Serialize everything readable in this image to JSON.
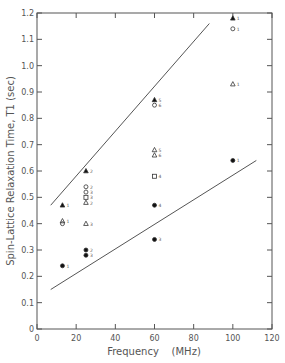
{
  "chart_data": {
    "type": "scatter",
    "title": "",
    "xlabel": "Frequency    (MHz)",
    "ylabel": "Spin-Lattice Relaxation Time, T1 (sec)",
    "xlim": [
      0,
      120
    ],
    "ylim": [
      0,
      1.2
    ],
    "xticks": [
      0,
      20,
      40,
      60,
      80,
      100,
      120
    ],
    "yticks": [
      0,
      0.1,
      0.2,
      0.3,
      0.4,
      0.5,
      0.6,
      0.7,
      0.8,
      0.9,
      1.0,
      1.1,
      1.2
    ],
    "xtick_labels": [
      "0",
      "20",
      "40",
      "60",
      "80",
      "100",
      "120"
    ],
    "ytick_labels": [
      "0",
      "0.1",
      "0.2",
      "0.3",
      "0.4",
      "0.5",
      "0.6",
      "0.7",
      "0.8",
      "0.9",
      "1.0",
      "1.1",
      "1.2"
    ],
    "grid": false,
    "legend": null,
    "series": [
      {
        "name": "filled-triangle",
        "marker": "triangle-filled",
        "points": [
          {
            "x": 13,
            "y": 0.47,
            "label": "1"
          },
          {
            "x": 25,
            "y": 0.6,
            "label": "2"
          },
          {
            "x": 60,
            "y": 0.87,
            "label": "5"
          },
          {
            "x": 100,
            "y": 1.18,
            "label": "1"
          }
        ]
      },
      {
        "name": "open-circle",
        "marker": "circle-open",
        "points": [
          {
            "x": 25,
            "y": 0.54,
            "label": "2"
          },
          {
            "x": 25,
            "y": 0.52,
            "label": "3"
          },
          {
            "x": 60,
            "y": 0.85,
            "label": "6"
          },
          {
            "x": 100,
            "y": 1.14,
            "label": "1"
          }
        ]
      },
      {
        "name": "open-square",
        "marker": "square-open",
        "points": [
          {
            "x": 25,
            "y": 0.5,
            "label": "3"
          },
          {
            "x": 60,
            "y": 0.58,
            "label": "4"
          }
        ]
      },
      {
        "name": "open-triangle",
        "marker": "triangle-open",
        "points": [
          {
            "x": 13,
            "y": 0.41,
            "label": "1"
          },
          {
            "x": 25,
            "y": 0.48,
            "label": "2"
          },
          {
            "x": 25,
            "y": 0.4,
            "label": "3"
          },
          {
            "x": 60,
            "y": 0.68,
            "label": "5"
          },
          {
            "x": 60,
            "y": 0.66,
            "label": "6"
          },
          {
            "x": 100,
            "y": 0.93,
            "label": "1"
          }
        ]
      },
      {
        "name": "open-circle-low",
        "marker": "circle-open",
        "points": [
          {
            "x": 13,
            "y": 0.4,
            "label": ""
          }
        ]
      },
      {
        "name": "filled-circle",
        "marker": "circle-filled",
        "points": [
          {
            "x": 13,
            "y": 0.24,
            "label": "1"
          },
          {
            "x": 25,
            "y": 0.3,
            "label": "2"
          },
          {
            "x": 25,
            "y": 0.28,
            "label": "3"
          },
          {
            "x": 60,
            "y": 0.47,
            "label": "4"
          },
          {
            "x": 60,
            "y": 0.34,
            "label": "3"
          },
          {
            "x": 100,
            "y": 0.64,
            "label": "1"
          }
        ]
      }
    ],
    "lines": [
      {
        "name": "upper-bound",
        "x": [
          7,
          88
        ],
        "y": [
          0.47,
          1.16
        ]
      },
      {
        "name": "lower-bound",
        "x": [
          7,
          112
        ],
        "y": [
          0.15,
          0.64
        ]
      }
    ]
  }
}
